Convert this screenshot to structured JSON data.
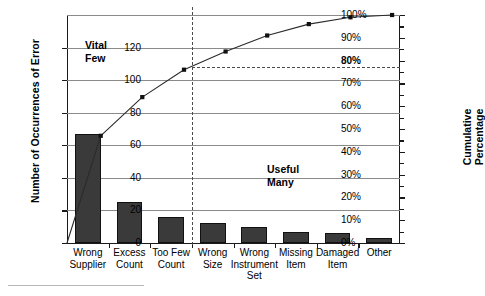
{
  "chart_data": {
    "type": "bar",
    "title": "",
    "subtitle": "",
    "categories": [
      "Wrong Supplier",
      "Excess Count",
      "Too Few Count",
      "Wrong Size",
      "Wrong Instrument Set",
      "Missing Item",
      "Damaged Item",
      "Other"
    ],
    "category_lines": [
      [
        "Wrong",
        "Supplier"
      ],
      [
        "Excess",
        "Count"
      ],
      [
        "Too Few",
        "Count"
      ],
      [
        "Wrong",
        "Size"
      ],
      [
        "Wrong",
        "Instrument",
        "Set"
      ],
      [
        "Missing",
        "Item"
      ],
      [
        "Damaged",
        "Item"
      ],
      [
        "Other"
      ]
    ],
    "values": [
      67,
      25,
      16,
      12,
      10,
      7,
      6,
      3
    ],
    "cumulative_percent": [
      47,
      64,
      76,
      84,
      91,
      96,
      99,
      101
    ],
    "xlabel": "",
    "ylabel": "Number of Occurrences of Error",
    "ylabel_secondary": "Cumulative Percentage",
    "ylim": [
      0,
      140
    ],
    "ylim_secondary": [
      0,
      100
    ],
    "yticks": [
      0,
      20,
      40,
      60,
      80,
      100,
      120
    ],
    "ytick_labels": [
      "0",
      "20",
      "40",
      "60",
      "80",
      "100",
      "120"
    ],
    "yticks_secondary": [
      0,
      10,
      20,
      30,
      40,
      50,
      60,
      70,
      80,
      90,
      100
    ],
    "ytick_labels_secondary": [
      "0%",
      "10%",
      "20%",
      "30%",
      "40%",
      "50%",
      "60%",
      "70%",
      "80%",
      "90%",
      "100%"
    ],
    "highlighted_secondary_tick": "80%",
    "grid": true,
    "legend": "none",
    "series": [
      {
        "name": "Number of Occurrences of Error",
        "type": "bar",
        "values": [
          67,
          25,
          16,
          12,
          10,
          7,
          6,
          3
        ]
      },
      {
        "name": "Cumulative Percentage",
        "type": "line",
        "values": [
          47,
          64,
          76,
          84,
          91,
          96,
          99,
          101
        ]
      }
    ],
    "annotations": [
      {
        "name": "vital-few",
        "lines": [
          "Vital",
          "Few"
        ],
        "x_category_range": [
          0,
          2
        ]
      },
      {
        "name": "useful-many",
        "lines": [
          "Useful",
          "Many"
        ],
        "x_category_range": [
          3,
          7
        ]
      },
      {
        "name": "eighty-percent-reference",
        "type": "dashed-horizontal",
        "value": 77
      },
      {
        "name": "vital-few-divider",
        "type": "dashed-vertical",
        "after_category": "Too Few Count"
      }
    ],
    "colors": {
      "bar_fill": "#3a3a3a",
      "bar_stroke": "#111111",
      "line": "#2b2b2b",
      "marker": "#111111",
      "grid": "#8a8a8a",
      "axis": "#1a1a1a",
      "dashed": "#4a4a4a",
      "background": "#ffffff"
    }
  },
  "axes": {
    "left_title": "Number of Occurrences of Error",
    "right_title_lines": [
      "Cumulative",
      "Percentage"
    ]
  },
  "annotations": {
    "vital_few_lines": [
      "Vital",
      "Few"
    ],
    "useful_many_lines": [
      "Useful",
      "Many"
    ]
  }
}
